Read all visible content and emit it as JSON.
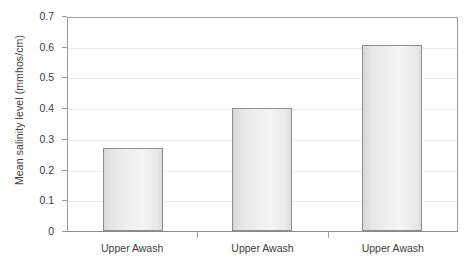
{
  "chart_data": {
    "type": "bar",
    "title": "",
    "subtitle": "",
    "xlabel": "",
    "ylabel": "Mean salinity level (mmhos/cm)",
    "categories": [
      "Upper Awash",
      "Upper Awash",
      "Upper Awash"
    ],
    "values": [
      0.27,
      0.4,
      0.605
    ],
    "ylim": [
      0,
      0.7
    ],
    "ytick_values": [
      0,
      0.1,
      0.2,
      0.3,
      0.4,
      0.5,
      0.6,
      0.7
    ],
    "ytick_labels": [
      "0",
      "0.1",
      "0.2",
      "0.3",
      "0.4",
      "0.5",
      "0.6",
      "0.7"
    ],
    "grid": "horizontal",
    "legend": "none",
    "annotations": [],
    "colors": {
      "bar_fill_light": "#f4f4f4",
      "bar_fill_dark": "#d7d7d7",
      "bar_border": "#8d8d8d",
      "gridline": "#ededed",
      "axis": "#9a9a9a",
      "text": "#404040",
      "background": "#ffffff"
    }
  }
}
